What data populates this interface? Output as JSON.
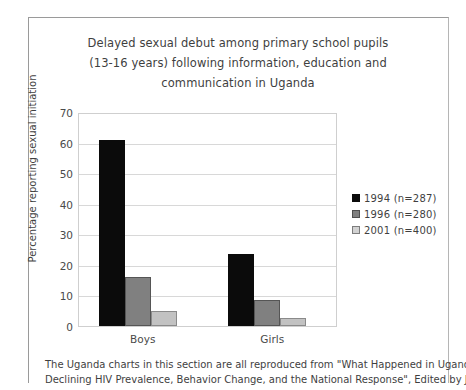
{
  "chart_data": {
    "type": "bar",
    "title": "Delayed sexual debut among primary school pupils (13-16 years) following information, education and communication in Uganda",
    "title_lines": [
      "Delayed sexual debut among primary school pupils",
      "(13-16 years) following information, education and",
      "communication in Uganda"
    ],
    "xlabel": "",
    "ylabel": "Percentage reporting sexual initiation",
    "categories": [
      "Boys",
      "Girls"
    ],
    "ylim": [
      0,
      70
    ],
    "ytick_step": 10,
    "yticks": [
      "0",
      "10",
      "20",
      "30",
      "40",
      "50",
      "60",
      "70"
    ],
    "grid": true,
    "legend_position": "right",
    "series": [
      {
        "name": "1994 (n=287)",
        "values": [
          61,
          23.5
        ],
        "color": "#0b0b0b"
      },
      {
        "name": "1996 (n=280)",
        "values": [
          16,
          8.5
        ],
        "color": "#808080"
      },
      {
        "name": "2001  (n=400)",
        "values": [
          5,
          2.5
        ],
        "color": "#c2c2c2"
      }
    ]
  },
  "footnote": {
    "lines": [
      "The Uganda charts in this section are all reproduced from \"What Happened in Uganda?",
      "Declining HIV Prevalence, Behavior Change, and the National Response\", Edited by Janice"
    ]
  }
}
